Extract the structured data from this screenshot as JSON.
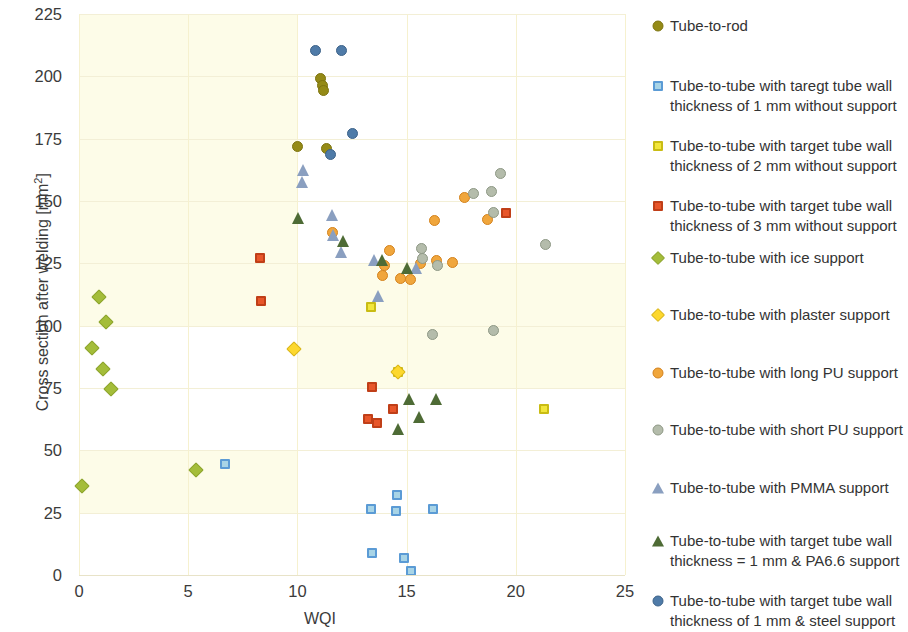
{
  "chart_data": {
    "type": "scatter",
    "title": "",
    "xlabel": "WQI",
    "ylabel": "Cross section after welding [mm²]",
    "xlim": [
      0,
      25
    ],
    "ylim": [
      0,
      225
    ],
    "xticks": [
      0,
      5,
      10,
      15,
      20,
      25
    ],
    "yticks": [
      0,
      25,
      50,
      75,
      100,
      125,
      150,
      175,
      200,
      225
    ],
    "grid": true,
    "legend_position": "right",
    "series": [
      {
        "name": "Tube-to-rod",
        "marker": "circle",
        "color": "#948a16",
        "edge": "#7d7410",
        "points": [
          [
            11.05,
            199.0
          ],
          [
            11.15,
            196.5
          ],
          [
            11.2,
            194.5
          ],
          [
            10.0,
            172.0
          ],
          [
            11.35,
            171.0
          ]
        ]
      },
      {
        "name": "Tube-to-tube with taregt tube wall thickness of 1 mm without support",
        "marker": "square",
        "color": "#a8d4e6",
        "edge": "#5b9bd5",
        "points": [
          [
            6.7,
            44.5
          ],
          [
            13.35,
            26.5
          ],
          [
            14.55,
            32.0
          ],
          [
            14.5,
            25.5
          ],
          [
            16.2,
            26.5
          ],
          [
            13.4,
            9.0
          ],
          [
            14.9,
            7.0
          ],
          [
            15.2,
            1.5
          ]
        ]
      },
      {
        "name": "Tube-to-tube with target tube wall thickness of 2 mm without support",
        "marker": "square",
        "color": "#f2e63c",
        "edge": "#c9bc14",
        "points": [
          [
            13.35,
            107.5
          ],
          [
            14.6,
            81.5
          ],
          [
            21.3,
            66.5
          ]
        ]
      },
      {
        "name": "Tube-to-tube with target tube wall thickness of 3 mm without support",
        "marker": "square",
        "color": "#e8562a",
        "edge": "#c03f18",
        "points": [
          [
            8.3,
            127.0
          ],
          [
            8.35,
            110.0
          ],
          [
            19.55,
            145.0
          ],
          [
            13.4,
            75.5
          ],
          [
            13.25,
            62.5
          ],
          [
            13.65,
            61.0
          ],
          [
            14.4,
            66.5
          ]
        ]
      },
      {
        "name": "Tube-to-tube with ice support",
        "marker": "diamond",
        "color": "#a4bd3a",
        "edge": "#8ba32a",
        "points": [
          [
            0.9,
            111.5
          ],
          [
            1.25,
            101.5
          ],
          [
            0.6,
            91.0
          ],
          [
            1.1,
            82.5
          ],
          [
            1.45,
            74.5
          ],
          [
            0.15,
            35.5
          ],
          [
            5.35,
            42.0
          ]
        ]
      },
      {
        "name": "Tube-to-tube with plaster support",
        "marker": "diamond",
        "color": "#fdd82e",
        "edge": "#d9b516",
        "points": [
          [
            9.85,
            90.5
          ],
          [
            14.6,
            81.5
          ]
        ]
      },
      {
        "name": "Tube-to-tube with long PU support",
        "marker": "circle",
        "color": "#f0a63c",
        "edge": "#d4821c",
        "points": [
          [
            11.6,
            137.5
          ],
          [
            17.65,
            151.5
          ],
          [
            16.3,
            142.0
          ],
          [
            14.2,
            130.0
          ],
          [
            14.0,
            124.0
          ],
          [
            17.1,
            125.5
          ],
          [
            16.35,
            126.0
          ],
          [
            15.65,
            125.0
          ],
          [
            13.9,
            120.0
          ],
          [
            14.7,
            119.0
          ],
          [
            15.2,
            118.5
          ],
          [
            18.7,
            142.5
          ]
        ]
      },
      {
        "name": "Tube-to-tube with short PU support",
        "marker": "circle",
        "color": "#b4bcab",
        "edge": "#8e9885",
        "points": [
          [
            19.3,
            161.0
          ],
          [
            18.9,
            154.0
          ],
          [
            18.05,
            153.0
          ],
          [
            19.0,
            145.5
          ],
          [
            21.35,
            132.5
          ],
          [
            15.75,
            127.0
          ],
          [
            16.4,
            124.0
          ],
          [
            15.7,
            131.0
          ],
          [
            19.0,
            98.0
          ],
          [
            16.2,
            96.5
          ]
        ]
      },
      {
        "name": "Tube-to-tube with PMMA support",
        "marker": "triangle",
        "color": "#8a9fc0",
        "edge": "#6b82a8",
        "points": [
          [
            10.25,
            162.5
          ],
          [
            10.2,
            157.5
          ],
          [
            11.6,
            144.5
          ],
          [
            11.65,
            136.5
          ],
          [
            12.0,
            129.5
          ],
          [
            13.5,
            126.5
          ],
          [
            15.45,
            123.0
          ],
          [
            13.7,
            112.0
          ]
        ]
      },
      {
        "name": "Tube-to-tube with target tube wall thickness = 1 mm & PA6.6 support",
        "marker": "triangle",
        "color": "#4e6b35",
        "edge": "#3c5328",
        "points": [
          [
            10.05,
            143.0
          ],
          [
            12.1,
            134.0
          ],
          [
            13.9,
            126.5
          ],
          [
            15.05,
            123.0
          ],
          [
            15.1,
            70.5
          ],
          [
            16.35,
            70.5
          ],
          [
            15.6,
            63.5
          ],
          [
            14.6,
            58.5
          ]
        ]
      },
      {
        "name": "Tube-to-tube with target tube wall thickness of 1 mm & steel support",
        "marker": "circle",
        "color": "#4f7ba8",
        "edge": "#3d6389",
        "points": [
          [
            10.85,
            210.5
          ],
          [
            12.0,
            210.5
          ],
          [
            12.5,
            177.0
          ],
          [
            11.5,
            168.5
          ]
        ]
      }
    ]
  },
  "axes": {
    "y_title_main": "Cross section after welding [mm",
    "y_title_sup": "2",
    "y_title_tail": "]",
    "x_title": "WQI",
    "yticks": [
      "225",
      "200",
      "175",
      "150",
      "125",
      "100",
      "75",
      "50",
      "25",
      "0"
    ],
    "xticks": [
      "0",
      "5",
      "10",
      "15",
      "20",
      "25"
    ]
  },
  "legend": {
    "items": [
      {
        "label": "Tube-to-rod",
        "icon": "filled-circle-marker-icon"
      },
      {
        "label": "Tube-to-tube with taregt tube wall thickness of 1 mm without support",
        "icon": "light-blue-square-marker-icon"
      },
      {
        "label": "Tube-to-tube with target tube wall thickness of 2 mm without support",
        "icon": "yellow-square-marker-icon"
      },
      {
        "label": "Tube-to-tube with target tube wall thickness of 3 mm without support",
        "icon": "red-square-marker-icon"
      },
      {
        "label": "Tube-to-tube with ice support",
        "icon": "green-diamond-marker-icon"
      },
      {
        "label": "Tube-to-tube with plaster support",
        "icon": "yellow-diamond-marker-icon"
      },
      {
        "label": "Tube-to-tube with long PU support",
        "icon": "orange-circle-marker-icon"
      },
      {
        "label": "Tube-to-tube with short PU support",
        "icon": "gray-circle-marker-icon"
      },
      {
        "label": "Tube-to-tube with PMMA support",
        "icon": "blue-triangle-marker-icon"
      },
      {
        "label": "Tube-to-tube with target tube wall thickness = 1 mm & PA6.6 support",
        "icon": "dark-green-triangle-marker-icon"
      },
      {
        "label": "Tube-to-tube with target tube wall thickness of 1 mm & steel support",
        "icon": "blue-circle-marker-icon"
      }
    ]
  }
}
